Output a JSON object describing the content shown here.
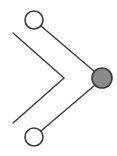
{
  "canvas": {
    "width": 117,
    "height": 156,
    "background": "#ffffff"
  },
  "style": {
    "stroke_color": "#3b3b3b",
    "stroke_width": 1.4,
    "node_stroke_color": "#3b3b3b",
    "node_stroke_width": 1.6,
    "node_fill_empty": "#ffffff",
    "node_fill_selected": "#8a8a8a",
    "chevron_stroke_color": "#3b3b3b",
    "chevron_stroke_width": 1.4
  },
  "chart_data": {
    "type": "diagram",
    "title": "",
    "nodes": [
      {
        "id": "node-top",
        "label": "",
        "cx": 34,
        "cy": 20,
        "r": 9,
        "fill": "#ffffff",
        "state": "unfilled"
      },
      {
        "id": "node-bottom",
        "label": "",
        "cx": 34,
        "cy": 137,
        "r": 9,
        "fill": "#ffffff",
        "state": "unfilled"
      },
      {
        "id": "node-right",
        "label": "",
        "cx": 102,
        "cy": 78,
        "r": 10,
        "fill": "#8a8a8a",
        "state": "filled"
      }
    ],
    "edges": [
      {
        "id": "edge-top-right",
        "from": "node-top",
        "to": "node-right",
        "x1": 41,
        "y1": 26,
        "x2": 95,
        "y2": 72
      },
      {
        "id": "edge-bottom-right",
        "from": "node-bottom",
        "to": "node-right",
        "x1": 41,
        "y1": 131,
        "x2": 95,
        "y2": 85
      }
    ],
    "shapes": [
      {
        "id": "chevron",
        "type": "polyline",
        "points": "13,33 64,78 13,123",
        "fill": "none"
      }
    ]
  }
}
